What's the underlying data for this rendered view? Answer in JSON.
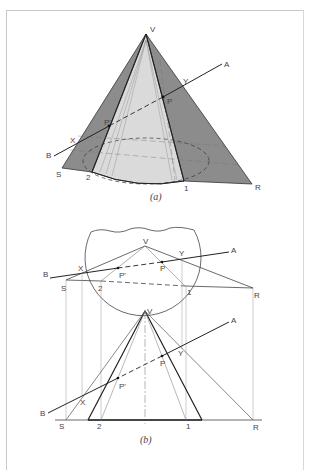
{
  "figure_a": {
    "caption": "(a)",
    "labels": {
      "V": "V",
      "A": "A",
      "B": "B",
      "Y": "Y",
      "P": "P",
      "P_prime": "P'",
      "X": "X",
      "S": "S",
      "R": "R",
      "pt2": "2",
      "pt1": "1"
    },
    "colors": {
      "plane_fill": "#8c8c8c",
      "cone_fill": "#dadada",
      "line": "#333333"
    }
  },
  "figure_b": {
    "caption": "(b)",
    "top_view_labels": {
      "V": "V",
      "A": "A",
      "B": "B",
      "Y": "Y",
      "P": "P",
      "P_prime": "P'",
      "X": "X",
      "S": "S",
      "R": "R",
      "pt2": "2",
      "pt1": "1"
    },
    "front_view_labels": {
      "V": "V",
      "A": "A",
      "B": "B",
      "Y": "Y",
      "P": "P",
      "P_prime": "P'",
      "X": "X",
      "S": "S",
      "R": "R",
      "pt2": "2",
      "pt1": "1"
    }
  }
}
